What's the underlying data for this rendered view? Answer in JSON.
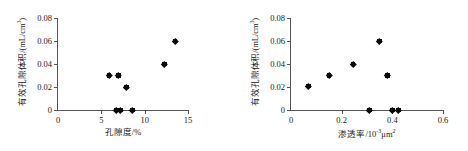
{
  "chart_data": [
    {
      "type": "scatter",
      "panel": "left",
      "title": "",
      "xlabel": "孔隙度/%",
      "ylabel": "有效孔隙体积/(mL/cm",
      "ylabel_sup": "3",
      "ylabel_tail": ")",
      "xlim": [
        0,
        15
      ],
      "ylim": [
        0,
        0.08
      ],
      "xticks": [
        "0",
        "5",
        "10",
        "15"
      ],
      "xtick_values": [
        0,
        5,
        10,
        15
      ],
      "yticks": [
        "0",
        "0.02",
        "0.04",
        "0.06",
        "0.08"
      ],
      "ytick_values": [
        0,
        0.02,
        0.04,
        0.06,
        0.08
      ],
      "grid": false,
      "legend": "none",
      "marker": "filled-diamond",
      "points": [
        {
          "x": 5.9,
          "y": 0.03
        },
        {
          "x": 7.0,
          "y": 0.03
        },
        {
          "x": 7.9,
          "y": 0.02
        },
        {
          "x": 6.7,
          "y": 0.0
        },
        {
          "x": 7.2,
          "y": 0.0
        },
        {
          "x": 8.6,
          "y": 0.0
        },
        {
          "x": 12.3,
          "y": 0.04
        },
        {
          "x": 13.5,
          "y": 0.06
        }
      ]
    },
    {
      "type": "scatter",
      "panel": "right",
      "title": "",
      "xlabel_main": "渗透率/10",
      "xlabel_sup": "-3",
      "xlabel_unit": "μm",
      "xlabel_unit_sup": "2",
      "ylabel": "有效孔隙体积/(mL/cm",
      "ylabel_sup": "3",
      "ylabel_tail": ")",
      "xlim": [
        0,
        0.6
      ],
      "ylim": [
        0,
        0.08
      ],
      "xticks": [
        "0",
        "0.2",
        "0.4",
        "0.6"
      ],
      "xtick_values": [
        0,
        0.2,
        0.4,
        0.6
      ],
      "yticks": [
        "0",
        "0.02",
        "0.04",
        "0.06",
        "0.08"
      ],
      "ytick_values": [
        0,
        0.02,
        0.04,
        0.06,
        0.08
      ],
      "grid": false,
      "legend": "none",
      "marker": "filled-diamond",
      "points": [
        {
          "x": 0.07,
          "y": 0.021
        },
        {
          "x": 0.15,
          "y": 0.03
        },
        {
          "x": 0.245,
          "y": 0.04
        },
        {
          "x": 0.35,
          "y": 0.06
        },
        {
          "x": 0.38,
          "y": 0.03
        },
        {
          "x": 0.31,
          "y": 0.0
        },
        {
          "x": 0.4,
          "y": 0.0
        },
        {
          "x": 0.425,
          "y": 0.0
        }
      ]
    }
  ],
  "colors": {
    "marker": "#0a0a0a",
    "axis": "#555555",
    "text": "#1a1a1a",
    "background": "#ffffff"
  }
}
